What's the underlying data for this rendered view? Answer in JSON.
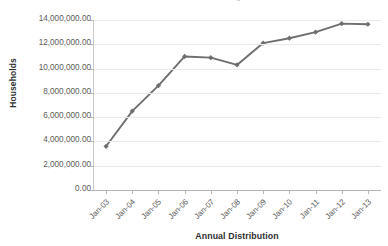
{
  "chart_data": {
    "type": "line",
    "title": "",
    "xlabel": "Annual Distribution",
    "ylabel": "Households",
    "categories": [
      "Jan-03",
      "Jan-04",
      "Jan-05",
      "Jan-06",
      "Jan-07",
      "Jan-08",
      "Jan-09",
      "Jan-10",
      "Jan-11",
      "Jan-12",
      "Jan-13"
    ],
    "values": [
      3600000,
      6500000,
      8600000,
      11000000,
      10900000,
      10300000,
      12100000,
      12500000,
      13000000,
      13700000,
      13650000
    ],
    "ylim": [
      0,
      14000000
    ],
    "ytick_values": [
      0,
      2000000,
      4000000,
      6000000,
      8000000,
      10000000,
      12000000,
      14000000
    ],
    "ytick_labels": [
      "0.00",
      "2,000,000.00",
      "4,000,000.00",
      "6,000,000.00",
      "8,000,000.00",
      "10,000,000.00",
      "12,000,000.00",
      "14,000,000.00"
    ],
    "grid": true,
    "legend": "none",
    "series_color": "#6e6e6e",
    "marker": "diamond",
    "gridline_color": "#e9e9e9",
    "axis_color": "#b5b5b5",
    "label_color": "#5a5a5a"
  },
  "clipped_title_text": "g"
}
